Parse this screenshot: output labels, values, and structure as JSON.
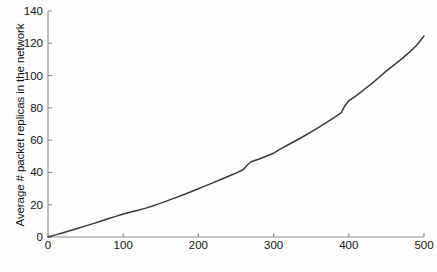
{
  "chart_data": {
    "type": "line",
    "title": "",
    "xlabel": "# Intermittencies encountered by a packet",
    "ylabel": "Average # packet replicas in the network",
    "xlim": [
      0,
      500
    ],
    "ylim": [
      0,
      140
    ],
    "xticks": [
      0,
      100,
      200,
      300,
      400,
      500
    ],
    "yticks": [
      0,
      20,
      40,
      60,
      80,
      100,
      120,
      140
    ],
    "xtick_labels": [
      "0",
      "100",
      "200",
      "300",
      "400",
      "500"
    ],
    "ytick_labels": [
      "0",
      "20",
      "40",
      "60",
      "80",
      "100",
      "120",
      "140"
    ],
    "grid": false,
    "legend": null,
    "line_color": "#3a3a3a",
    "axis_color": "#8c8c8c",
    "series": [
      {
        "name": "Average # packet replicas",
        "x": [
          0,
          10,
          20,
          30,
          40,
          50,
          60,
          70,
          80,
          90,
          100,
          110,
          120,
          130,
          140,
          150,
          160,
          170,
          180,
          190,
          200,
          210,
          220,
          230,
          240,
          250,
          260,
          265,
          270,
          280,
          290,
          300,
          310,
          320,
          330,
          340,
          350,
          360,
          370,
          380,
          390,
          395,
          400,
          410,
          420,
          430,
          440,
          450,
          460,
          470,
          480,
          490,
          500
        ],
        "values": [
          0,
          1.3,
          2.6,
          4.0,
          5.4,
          6.9,
          8.3,
          9.8,
          11.3,
          12.8,
          14.2,
          15.5,
          16.6,
          17.9,
          19.4,
          21.0,
          22.7,
          24.4,
          26.2,
          28.0,
          29.9,
          31.8,
          33.7,
          35.6,
          37.6,
          39.6,
          41.8,
          44.6,
          46.6,
          48.2,
          50.0,
          51.9,
          54.8,
          57.3,
          59.8,
          62.4,
          65.1,
          67.9,
          70.8,
          73.8,
          77.0,
          81.5,
          84.3,
          87.6,
          91.2,
          94.9,
          98.8,
          102.9,
          106.5,
          110.2,
          114.2,
          118.6,
          124.5
        ]
      }
    ]
  }
}
